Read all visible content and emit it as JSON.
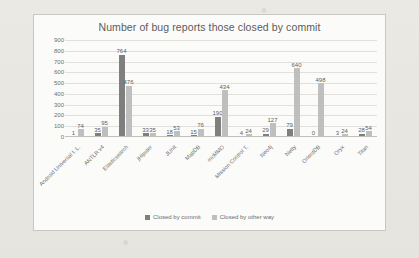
{
  "chart_data": {
    "type": "bar",
    "title": "Number of bug reports those closed by commit",
    "xlabel": "",
    "ylabel": "",
    "ylim": [
      0,
      900
    ],
    "ytick_step": 100,
    "yticks": [
      900,
      800,
      700,
      600,
      500,
      400,
      300,
      200,
      100,
      0
    ],
    "grid": true,
    "legend_position": "bottom",
    "categories": [
      "Android Universal I. L.",
      "ANTLR v4",
      "Elasticsearch",
      "jHipster",
      "JUnit",
      "MapDB",
      "mcMMO",
      "Mission Control T.",
      "Neo4j",
      "Netty",
      "OrientDB",
      "Oryx",
      "Titan"
    ],
    "series": [
      {
        "name": "Closed by commit",
        "color": "#7f7f7f",
        "values": [
          1,
          35,
          764,
          33,
          18,
          15,
          190,
          4,
          29,
          79,
          0,
          3,
          28
        ]
      },
      {
        "name": "Closed by other way",
        "color": "#bfbfbf",
        "values": [
          74,
          95,
          476,
          35,
          53,
          76,
          434,
          24,
          127,
          640,
          498,
          24,
          54
        ]
      }
    ]
  },
  "legend": {
    "entries": [
      {
        "label": "Closed by commit",
        "color": "#7f7f7f"
      },
      {
        "label": "Closed by other way",
        "color": "#bfbfbf"
      }
    ]
  }
}
